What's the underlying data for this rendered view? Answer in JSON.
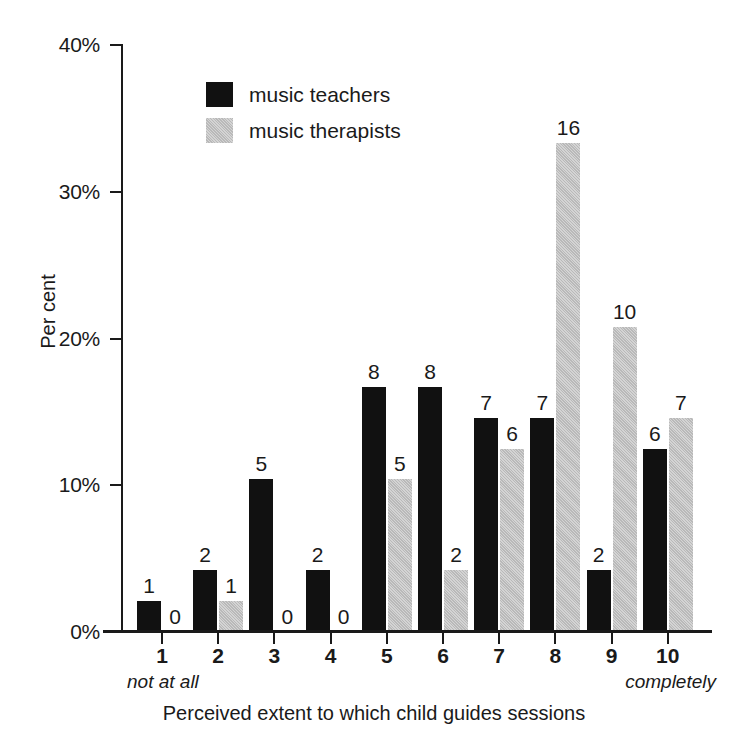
{
  "chart_data": {
    "type": "bar",
    "title": "",
    "xlabel": "Perceived extent to which child guides sessions",
    "ylabel": "Per cent",
    "categories": [
      "1",
      "2",
      "3",
      "4",
      "5",
      "6",
      "7",
      "8",
      "9",
      "10"
    ],
    "ylim": [
      0,
      40
    ],
    "yticks": [
      0,
      10,
      20,
      30,
      40
    ],
    "ytick_labels": [
      "0%",
      "10%",
      "20%",
      "30%",
      "40%"
    ],
    "grid": false,
    "legend_position": "upper-left-inside",
    "x_endpoint_labels": {
      "left": "not at all",
      "right": "completely"
    },
    "series": [
      {
        "name": "music teachers",
        "color": "#111111",
        "counts": [
          1,
          2,
          5,
          2,
          8,
          8,
          7,
          7,
          2,
          6
        ],
        "values": [
          2.1,
          4.2,
          10.4,
          4.2,
          16.7,
          16.7,
          14.6,
          14.6,
          4.2,
          12.5
        ],
        "data_labels": [
          "1",
          "2",
          "5",
          "2",
          "8",
          "8",
          "7",
          "7",
          "2",
          "6"
        ]
      },
      {
        "name": "music therapists",
        "color": "#c6c6c6",
        "counts": [
          0,
          1,
          0,
          0,
          5,
          2,
          6,
          16,
          10,
          7
        ],
        "values": [
          0,
          2.1,
          0,
          0,
          10.4,
          4.2,
          12.5,
          33.3,
          20.8,
          14.6
        ],
        "data_labels": [
          "0",
          "1",
          "0",
          "0",
          "5",
          "2",
          "6",
          "16",
          "10",
          "7"
        ]
      }
    ]
  },
  "legend": {
    "items": [
      {
        "label": "music teachers"
      },
      {
        "label": "music therapists"
      }
    ]
  }
}
